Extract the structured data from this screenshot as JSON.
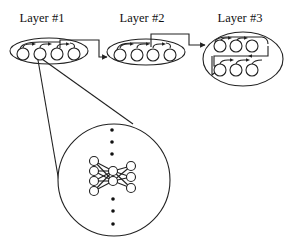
{
  "diagram": {
    "type": "hierarchical-neural-network-layers",
    "layers": [
      {
        "id": "layer-1",
        "label": "Layer #1",
        "nodes": 4,
        "arrangement": "row",
        "connects_to": "layer-2"
      },
      {
        "id": "layer-2",
        "label": "Layer #2",
        "nodes": 4,
        "arrangement": "row",
        "connects_to": "layer-3"
      },
      {
        "id": "layer-3",
        "label": "Layer #3",
        "nodes": 6,
        "arrangement": "two-rows",
        "connects_to": null
      }
    ],
    "zoom_inset": {
      "source": "layer-1 node 2",
      "content": "fully-connected sub-network",
      "sub_network_layers": [
        4,
        2,
        3
      ],
      "ellipsis_dots_above": 3,
      "ellipsis_dots_below": 3
    },
    "colors": {
      "stroke": "#222222",
      "background": "#ffffff"
    }
  }
}
